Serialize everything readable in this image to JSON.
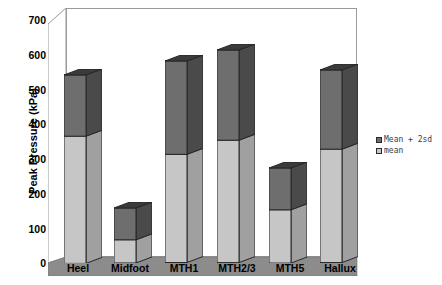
{
  "chart_data": {
    "type": "bar",
    "title": "",
    "subtitle": "",
    "xlabel": "",
    "ylabel": "Peak Pressure (kPa)",
    "ylim": [
      0,
      700
    ],
    "ytick_values": [
      700,
      600,
      500,
      400,
      300,
      200,
      100,
      0
    ],
    "ytick_labels": [
      "700",
      "600",
      "500",
      "400",
      "300",
      "200",
      "100",
      "0"
    ],
    "grid": false,
    "legend_position": "right",
    "stacked": true,
    "three_d": true,
    "categories": [
      "Heel",
      "Midfoot",
      "MTH1",
      "MTH2/3",
      "MTH5",
      "Hallux"
    ],
    "series": [
      {
        "name": "mean",
        "color": "#c6c6c6",
        "values": [
          368,
          67,
          313,
          354,
          154,
          328
        ]
      },
      {
        "name": "Mean + 2sd",
        "color": "#6e6e6e",
        "values": [
          545,
          159,
          583,
          615,
          275,
          557
        ]
      }
    ],
    "annotations": []
  },
  "axes": {
    "y_title": "Peak Pressure (kPa)",
    "y_ticks": [
      "700",
      "600",
      "500",
      "400",
      "300",
      "200",
      "100",
      "0"
    ],
    "x_ticks": [
      "Heel",
      "Midfoot",
      "MTH1",
      "MTH2/3",
      "MTH5",
      "Hallux"
    ]
  },
  "legend": {
    "items": [
      {
        "label": "Mean + 2sd",
        "color": "#6e6e6e",
        "swatch_name": "legend-swatch-mean-plus-2sd"
      },
      {
        "label": "mean",
        "color": "#c6c6c6",
        "swatch_name": "legend-swatch-mean"
      }
    ]
  },
  "colors": {
    "bar_dark_front": "#6e6e6e",
    "bar_dark_side": "#4a4a4a",
    "bar_dark_top": "#3b3b3b",
    "bar_light_front": "#c6c6c6",
    "bar_light_side": "#a0a0a0",
    "bar_light_top": "#d8d8d8",
    "floor": "#8c8c8c",
    "floor_left": "#767676",
    "frame": "#9a9a9a",
    "background": "#ffffff",
    "text": "#000000"
  }
}
